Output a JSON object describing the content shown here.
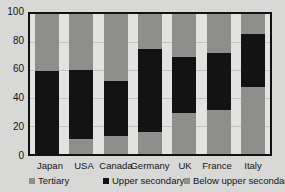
{
  "chart_data": {
    "type": "bar",
    "title": "",
    "subtitle": "",
    "xlabel": "",
    "ylabel": "",
    "stacked": true,
    "grid": true,
    "legend_position": "bottom",
    "ylim": [
      0,
      100
    ],
    "yticks": [
      0,
      20,
      40,
      60,
      80,
      100
    ],
    "ytick_labels": [
      "0",
      "20",
      "40",
      "60",
      "80",
      "100"
    ],
    "categories": [
      "Japan",
      "USA",
      "Canada",
      "Germany",
      "UK",
      "France",
      "Italy"
    ],
    "series": [
      {
        "name": "Below upper secondary",
        "color": "#8e8e8c",
        "values": [
          0,
          11,
          13,
          16,
          29.5,
          31.5,
          48
        ]
      },
      {
        "name": "Upper secondary",
        "color": "#131313",
        "values": [
          59.5,
          49,
          39,
          59,
          39.5,
          41,
          37.5
        ]
      },
      {
        "name": "Tertiary",
        "color": "#8e8e8c",
        "values": [
          40.5,
          40,
          48,
          25,
          31,
          27.5,
          14.5
        ]
      }
    ],
    "cumulative_tops": {
      "below_upper_secondary": [
        0,
        11,
        13,
        16,
        29.5,
        31.5,
        48
      ],
      "upper_secondary": [
        59.5,
        60,
        52,
        75,
        69,
        72.5,
        85.5
      ],
      "tertiary": [
        100,
        100,
        100,
        100,
        100,
        100,
        100
      ]
    }
  },
  "legend": {
    "items": [
      {
        "label": "Tertiary",
        "swatch": "tertiary-swatch"
      },
      {
        "label": "Upper secondary",
        "swatch": "upper-secondary-swatch"
      },
      {
        "label": "Below upper secondary",
        "swatch": "below-upper-secondary-swatch"
      }
    ]
  },
  "colors": {
    "background": "#d8d8d6",
    "plot_background": "#e2e2e0",
    "axis": "#111111",
    "gridline": "#c3c3c1",
    "dark_segment": "#131313",
    "gray_segment": "#8e8e8c"
  }
}
